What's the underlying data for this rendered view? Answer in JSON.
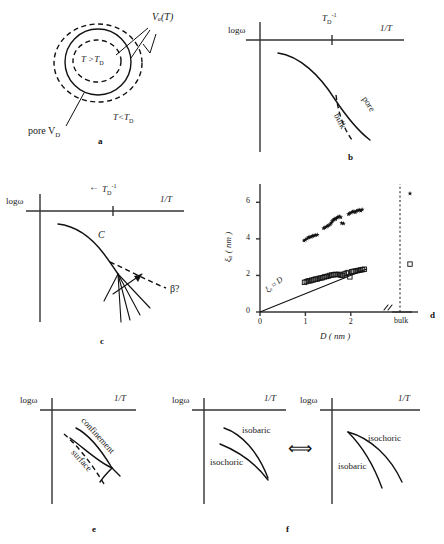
{
  "figure": {
    "caption_letters": [
      "a",
      "b",
      "c",
      "d",
      "e",
      "f"
    ],
    "background": "#ffffff",
    "ink": "#111111"
  },
  "panels": {
    "a": {
      "letter": "a",
      "type": "schematic-diagram",
      "labels": {
        "cooperative_volume": "Vₐ(T)",
        "inner_region": "T >T",
        "inner_region_sub": "D",
        "outer_region": "T<T",
        "outer_region_sub": "D",
        "pore": "pore V",
        "pore_sub": "D"
      }
    },
    "b": {
      "letter": "b",
      "type": "schematic-plot",
      "axes": {
        "y": "logω",
        "x": "1/T"
      },
      "ticks": {
        "td_inverse": "T",
        "td_inverse_sub": "D",
        "td_inverse_sup": "-1"
      },
      "curves": [
        {
          "name": "pore",
          "label": "pore",
          "style": "solid"
        },
        {
          "name": "bulk",
          "label": "bulk",
          "style": "dashed"
        }
      ]
    },
    "c": {
      "letter": "c",
      "type": "schematic-plot",
      "axes": {
        "y": "logω",
        "x": "1/T"
      },
      "ticks": {
        "arrow": "←",
        "td_inverse": "T",
        "td_inverse_sub": "D",
        "td_inverse_sup": "-1"
      },
      "labels": {
        "crossover": "C",
        "beta": "β?"
      },
      "curves": [
        {
          "name": "alpha-master",
          "style": "solid"
        },
        {
          "name": "beta-extrapolation",
          "style": "dashed"
        },
        {
          "name": "fan-branch-1",
          "style": "solid"
        },
        {
          "name": "fan-branch-2",
          "style": "solid"
        },
        {
          "name": "fan-branch-3",
          "style": "solid"
        },
        {
          "name": "fan-branch-4",
          "style": "solid"
        },
        {
          "name": "fan-branch-5",
          "style": "solid"
        }
      ]
    },
    "d": {
      "letter": "d",
      "type": "scatter-plot"
    },
    "e": {
      "letter": "e",
      "type": "schematic-plot",
      "axes": {
        "y": "logω",
        "x": "1/T"
      },
      "labels": {
        "confinement": "confinement",
        "surface": "surface"
      }
    },
    "f": {
      "letter": "f",
      "type": "schematic-plot-pair",
      "connector": "⟺",
      "left": {
        "axes": {
          "y": "logω",
          "x": "1/T"
        },
        "labels": {
          "upper": "isobaric",
          "lower": "isochoric"
        }
      },
      "right": {
        "axes": {
          "y": "logω",
          "x": "1/T"
        },
        "labels": {
          "upper": "isochoric",
          "lower": "isobaric"
        }
      }
    }
  },
  "chart_data": {
    "type": "scatter",
    "title": "",
    "xlabel": "D ( nm )",
    "ylabel": "ξₐ ( nm )",
    "xlim": [
      0,
      2.6
    ],
    "ylim": [
      0,
      7
    ],
    "xticks": [
      0,
      1,
      2
    ],
    "yticks": [
      0,
      2,
      4,
      6
    ],
    "xtick_labels": [
      "0",
      "1",
      "2"
    ],
    "ytick_labels": [
      "0",
      "2",
      "4",
      "6"
    ],
    "grid": false,
    "legend": false,
    "axis_break": true,
    "bulk_category_label": "bulk",
    "annotations": [
      {
        "text": "ξₐ ≈ D",
        "x": 0.42,
        "y": 0.72,
        "rotation": -38
      }
    ],
    "reference_line": {
      "name": "xi = D",
      "x": [
        0.0,
        2.35
      ],
      "y": [
        0.0,
        2.35
      ]
    },
    "series": [
      {
        "name": "upper-branch",
        "marker": "star-filled",
        "color": "#111111",
        "points": [
          [
            0.97,
            3.91
          ],
          [
            1.0,
            3.95
          ],
          [
            1.04,
            4.02
          ],
          [
            1.07,
            4.08
          ],
          [
            1.1,
            4.1
          ],
          [
            1.13,
            4.12
          ],
          [
            1.16,
            4.15
          ],
          [
            1.19,
            4.18
          ],
          [
            1.22,
            4.2
          ],
          [
            1.26,
            4.22
          ],
          [
            1.4,
            4.58
          ],
          [
            1.43,
            4.62
          ],
          [
            1.46,
            4.66
          ],
          [
            1.49,
            4.7
          ],
          [
            1.52,
            4.74
          ],
          [
            1.55,
            4.8
          ],
          [
            1.57,
            4.88
          ],
          [
            1.59,
            4.96
          ],
          [
            1.61,
            5.02
          ],
          [
            1.63,
            5.06
          ],
          [
            1.65,
            5.1
          ],
          [
            1.67,
            5.08
          ],
          [
            1.7,
            5.15
          ],
          [
            1.72,
            5.2
          ],
          [
            1.75,
            5.22
          ],
          [
            1.78,
            5.18
          ],
          [
            1.8,
            4.86
          ],
          [
            1.84,
            4.84
          ],
          [
            1.95,
            5.35
          ],
          [
            1.98,
            5.4
          ],
          [
            2.01,
            5.44
          ],
          [
            2.04,
            5.48
          ],
          [
            2.07,
            5.5
          ],
          [
            2.1,
            5.46
          ],
          [
            2.13,
            5.52
          ],
          [
            2.16,
            5.56
          ],
          [
            2.19,
            5.58
          ],
          [
            2.22,
            5.54
          ],
          [
            2.25,
            5.6
          ]
        ]
      },
      {
        "name": "lower-branch-squares",
        "marker": "square-open",
        "color": "#111111",
        "points": [
          [
            0.98,
            1.62
          ],
          [
            1.02,
            1.66
          ],
          [
            1.06,
            1.7
          ],
          [
            1.1,
            1.7
          ],
          [
            1.14,
            1.74
          ],
          [
            1.18,
            1.76
          ],
          [
            1.22,
            1.8
          ],
          [
            1.26,
            1.8
          ],
          [
            1.3,
            1.84
          ],
          [
            1.34,
            1.86
          ],
          [
            1.38,
            1.88
          ],
          [
            1.42,
            1.92
          ],
          [
            1.46,
            1.94
          ],
          [
            1.5,
            1.96
          ],
          [
            1.54,
            2.0
          ],
          [
            1.58,
            2.02
          ],
          [
            1.62,
            2.04
          ],
          [
            1.66,
            2.06
          ],
          [
            1.7,
            2.04
          ],
          [
            1.74,
            2.06
          ],
          [
            1.78,
            2.02
          ],
          [
            1.82,
            2.0
          ],
          [
            1.86,
            2.08
          ],
          [
            1.9,
            2.12
          ],
          [
            1.94,
            2.16
          ],
          [
            1.98,
            1.92
          ],
          [
            2.02,
            2.2
          ],
          [
            2.06,
            2.22
          ],
          [
            2.1,
            2.24
          ],
          [
            2.14,
            2.26
          ],
          [
            2.18,
            2.28
          ],
          [
            2.22,
            2.3
          ],
          [
            2.26,
            2.32
          ],
          [
            2.3,
            2.34
          ]
        ]
      },
      {
        "name": "bulk-points",
        "marker": "mixed",
        "color": "#111111",
        "points": [
          {
            "label": "bulk-upper",
            "marker": "star-filled",
            "y": 6.48
          },
          {
            "label": "bulk-lower",
            "marker": "square-open",
            "y": 2.62
          }
        ]
      }
    ]
  }
}
